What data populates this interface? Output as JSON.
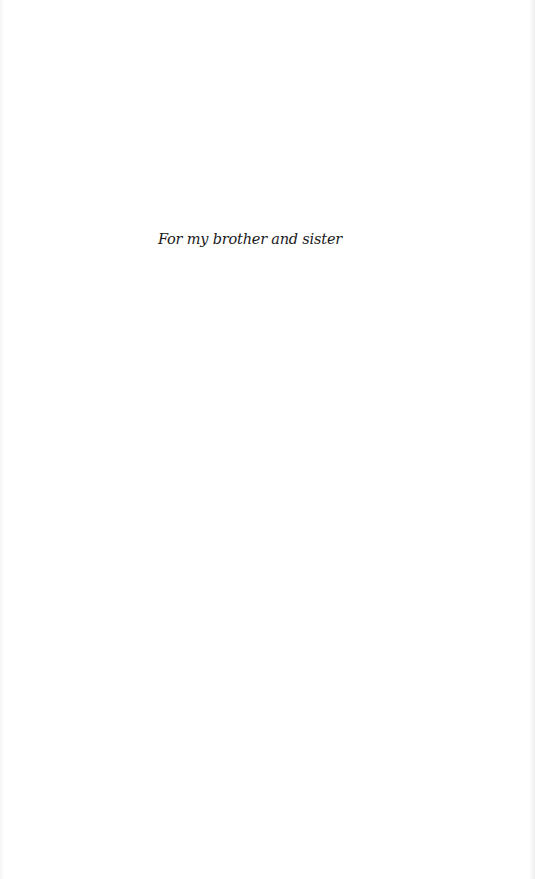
{
  "page": {
    "dedication": "For my brother and sister",
    "background_color": "#ffffff",
    "text_color": "#1a1a1a"
  }
}
